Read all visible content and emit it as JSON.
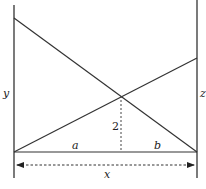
{
  "diagram": {
    "colors": {
      "stroke": "#333333",
      "background": "#ffffff"
    },
    "labels": {
      "left_wall": "y",
      "right_wall": "z",
      "left_segment": "a",
      "right_segment": "b",
      "crossing_height": "2",
      "total_width": "x"
    },
    "elements": [
      {
        "id": "left-wall",
        "type": "line",
        "from": [
          14,
          5
        ],
        "to": [
          14,
          178
        ]
      },
      {
        "id": "right-wall",
        "type": "line",
        "from": [
          197,
          0
        ],
        "to": [
          197,
          178
        ]
      },
      {
        "id": "baseline",
        "type": "line",
        "from": [
          14,
          152
        ],
        "to": [
          197,
          152
        ]
      },
      {
        "id": "descending-ladder",
        "type": "line",
        "from": [
          14,
          18
        ],
        "to": [
          197,
          152
        ]
      },
      {
        "id": "ascending-ladder",
        "type": "line",
        "from": [
          14,
          152
        ],
        "to": [
          197,
          58
        ]
      },
      {
        "id": "crossing-height-line",
        "type": "dashed-line",
        "from": [
          121,
          96
        ],
        "to": [
          121,
          152
        ]
      },
      {
        "id": "width-arrow",
        "type": "dashed-double-arrow",
        "from": [
          16,
          165
        ],
        "to": [
          195,
          165
        ]
      }
    ]
  }
}
